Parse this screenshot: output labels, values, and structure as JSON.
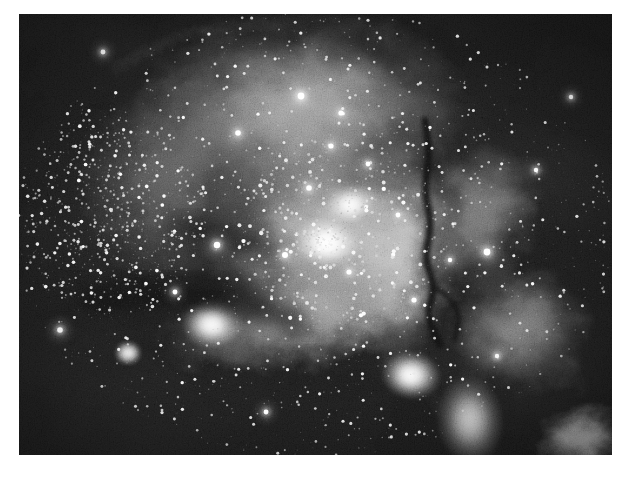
{
  "page": {
    "background_color": "#ffffff",
    "width": 629,
    "height": 480
  },
  "figure": {
    "name": "astronomical-image",
    "color_mode": "grayscale",
    "caption": "",
    "plate": {
      "x": 19,
      "y": 14,
      "width": 593,
      "height": 441,
      "background_color": "#0a0a0a",
      "border": "none"
    }
  },
  "chart_data": {
    "type": "heatmap",
    "title": "",
    "xlabel": "",
    "ylabel": "",
    "grid": false,
    "legend": "none",
    "colormap": "grayscale",
    "value_range": [
      0,
      255
    ],
    "plate_px": {
      "x": 19,
      "y": 14,
      "w": 593,
      "h": 441
    },
    "background_level": 14,
    "noise": {
      "type": "granular-film-grain",
      "amplitude": 26,
      "scale": 1.0
    },
    "nebula_regions": [
      {
        "name": "upper-shell-arc",
        "cx": 300,
        "cy": 110,
        "rx": 175,
        "ry": 105,
        "rot": -6,
        "peak": 150,
        "falloff": 0.72
      },
      {
        "name": "central-cluster-glow",
        "cx": 330,
        "cy": 235,
        "rx": 130,
        "ry": 110,
        "rot": 0,
        "peak": 176,
        "falloff": 0.6
      },
      {
        "name": "core-knot-bright",
        "cx": 327,
        "cy": 243,
        "rx": 34,
        "ry": 26,
        "rot": 10,
        "peak": 232,
        "falloff": 0.45
      },
      {
        "name": "core-knot-secondary",
        "cx": 350,
        "cy": 205,
        "rx": 26,
        "ry": 20,
        "rot": -12,
        "peak": 212,
        "falloff": 0.48
      },
      {
        "name": "ridge-right-of-core",
        "cx": 400,
        "cy": 255,
        "rx": 60,
        "ry": 120,
        "rot": 4,
        "peak": 150,
        "falloff": 0.66
      },
      {
        "name": "south-bar",
        "cx": 300,
        "cy": 320,
        "rx": 150,
        "ry": 52,
        "rot": -10,
        "peak": 132,
        "falloff": 0.7
      },
      {
        "name": "southwest-knot",
        "cx": 212,
        "cy": 324,
        "rx": 30,
        "ry": 24,
        "rot": 0,
        "peak": 214,
        "falloff": 0.44
      },
      {
        "name": "far-southwest-blob",
        "cx": 128,
        "cy": 353,
        "rx": 13,
        "ry": 11,
        "rot": 0,
        "peak": 205,
        "falloff": 0.4
      },
      {
        "name": "south-east-blob",
        "cx": 411,
        "cy": 375,
        "rx": 30,
        "ry": 24,
        "rot": 8,
        "peak": 218,
        "falloff": 0.46
      },
      {
        "name": "east-wisp-upper",
        "cx": 480,
        "cy": 215,
        "rx": 60,
        "ry": 85,
        "rot": 14,
        "peak": 104,
        "falloff": 0.78
      },
      {
        "name": "east-wisp-lower",
        "cx": 520,
        "cy": 330,
        "rx": 78,
        "ry": 70,
        "rot": -18,
        "peak": 110,
        "falloff": 0.78
      },
      {
        "name": "south-filament",
        "cx": 470,
        "cy": 420,
        "rx": 34,
        "ry": 46,
        "rot": -6,
        "peak": 150,
        "falloff": 0.64
      },
      {
        "name": "southeast-corner-glow",
        "cx": 585,
        "cy": 440,
        "rx": 48,
        "ry": 40,
        "rot": 0,
        "peak": 160,
        "falloff": 0.66
      },
      {
        "name": "west-diffuse-haze",
        "cx": 165,
        "cy": 180,
        "rx": 95,
        "ry": 110,
        "rot": 0,
        "peak": 74,
        "falloff": 0.82
      }
    ],
    "dark_lanes": [
      {
        "name": "main-dust-lane-vertical",
        "points": "425,120 430,155 424,190 432,225 424,258 436,288 426,315 440,345",
        "width": 7,
        "darkness": 0.92
      },
      {
        "name": "dust-lane-branch",
        "points": "436,288 452,300 460,318 454,340",
        "width": 5,
        "darkness": 0.8
      },
      {
        "name": "south-curved-bay",
        "points": "95,300 150,288 205,292 255,305 296,322",
        "width": 26,
        "darkness": 0.7
      },
      {
        "name": "north-rim-shadow",
        "points": "250,36 310,28 360,40 405,66",
        "width": 16,
        "darkness": 0.6
      },
      {
        "name": "mid-left-shadow",
        "points": "180,225 230,235 270,252",
        "width": 20,
        "darkness": 0.55
      }
    ],
    "star_fields": [
      {
        "name": "dense-western-cluster",
        "cx": 110,
        "cy": 215,
        "rx": 95,
        "ry": 105,
        "count": 900,
        "mag_mean": 0.4
      },
      {
        "name": "central-cluster",
        "cx": 335,
        "cy": 235,
        "rx": 105,
        "ry": 95,
        "count": 560,
        "mag_mean": 0.6
      },
      {
        "name": "general-field",
        "cx": 315,
        "cy": 234,
        "rx": 300,
        "ry": 225,
        "count": 2400,
        "mag_mean": 0.3
      }
    ],
    "bright_stars": [
      {
        "x": 301,
        "y": 96,
        "r": 3.4
      },
      {
        "x": 341,
        "y": 113,
        "r": 2.6
      },
      {
        "x": 238,
        "y": 133,
        "r": 2.8
      },
      {
        "x": 217,
        "y": 245,
        "x2": 0,
        "r": 3.2
      },
      {
        "x": 331,
        "y": 146,
        "r": 2.6
      },
      {
        "x": 368,
        "y": 164,
        "r": 2.4
      },
      {
        "x": 309,
        "y": 188,
        "r": 2.8
      },
      {
        "x": 285,
        "y": 255,
        "r": 3.0
      },
      {
        "x": 349,
        "y": 272,
        "r": 2.6
      },
      {
        "x": 398,
        "y": 215,
        "r": 2.4
      },
      {
        "x": 487,
        "y": 252,
        "r": 3.4
      },
      {
        "x": 536,
        "y": 170,
        "r": 2.2
      },
      {
        "x": 60,
        "y": 330,
        "r": 2.8
      },
      {
        "x": 175,
        "y": 292,
        "r": 2.4
      },
      {
        "x": 414,
        "y": 300,
        "r": 2.6
      },
      {
        "x": 266,
        "y": 412,
        "r": 2.4
      },
      {
        "x": 450,
        "y": 260,
        "r": 2.2
      },
      {
        "x": 497,
        "y": 356,
        "r": 2.2
      },
      {
        "x": 103,
        "y": 52,
        "r": 2.4
      },
      {
        "x": 571,
        "y": 97,
        "r": 2.2
      }
    ]
  },
  "annotations": {
    "labels": [],
    "scale_bar": null,
    "compass": null
  }
}
